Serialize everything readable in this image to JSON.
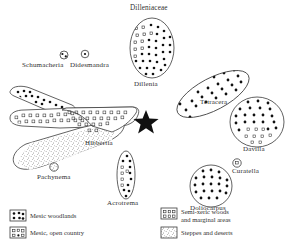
{
  "figure": {
    "title": "Dilleniaceae",
    "center_marker": "star"
  },
  "taxa": [
    {
      "id": "dillenia",
      "label": "Dillenia",
      "shape": "ellipse",
      "habitat": [
        "mesic-open-country",
        "mesic-woodlands"
      ]
    },
    {
      "id": "schumacheria",
      "label": "Schumacheria",
      "shape": "small-circle",
      "habitat": [
        "mesic-woodlands"
      ]
    },
    {
      "id": "didesmandra",
      "label": "Didesmandra",
      "shape": "small-circle",
      "habitat": [
        "mesic-woodlands"
      ]
    },
    {
      "id": "hibbertia",
      "label": "Hibbertia",
      "shape": "multi-lobe",
      "habitat": [
        "mesic-woodlands",
        "semi-xeric-woods",
        "steppes-and-deserts"
      ]
    },
    {
      "id": "pachynema",
      "label": "Pachynema",
      "shape": "small-circle",
      "habitat": [
        "steppes-and-deserts"
      ]
    },
    {
      "id": "acrotrema",
      "label": "Acrotrema",
      "shape": "narrow-ellipse",
      "habitat": [
        "mesic-woodlands",
        "mesic-open-country"
      ]
    },
    {
      "id": "tetracera",
      "label": "Tetracera",
      "shape": "oblique-ellipse",
      "habitat": [
        "mesic-woodlands"
      ]
    },
    {
      "id": "davilla",
      "label": "Davilla",
      "shape": "circle",
      "habitat": [
        "mesic-woodlands",
        "mesic-open-country"
      ]
    },
    {
      "id": "curatella",
      "label": "Curatella",
      "shape": "small-circle",
      "habitat": [
        "mesic-open-country"
      ]
    },
    {
      "id": "doliocarpus",
      "label": "Doliocarpus",
      "shape": "circle",
      "habitat": [
        "mesic-woodlands"
      ]
    }
  ],
  "legend": {
    "items": [
      {
        "id": "mesic-woodlands",
        "label": "Mesic woodlands",
        "swatch": "filled-dots"
      },
      {
        "id": "mesic-open-country",
        "label": "Mesic, open country",
        "swatch": "open-squares-dots"
      },
      {
        "id": "semi-xeric-woods",
        "label": "Semi-xeric woods",
        "label2": "and marginal areas",
        "swatch": "open-squares"
      },
      {
        "id": "steppes-and-deserts",
        "label": "Steppes and deserts",
        "swatch": "stipple"
      }
    ]
  },
  "colors": {
    "ink": "#2b2b2b",
    "paper": "#ffffff",
    "outline": "#3a3a3a"
  }
}
